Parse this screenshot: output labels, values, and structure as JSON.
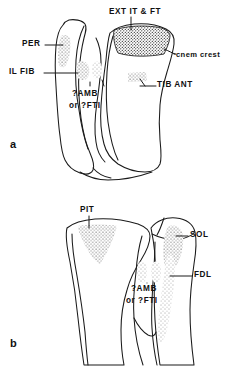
{
  "figure": {
    "type": "anatomical-line-drawing",
    "background_color": "#ffffff",
    "ink_color": "#1a1a1a",
    "width": 234,
    "height": 367
  },
  "panels": [
    {
      "id": "a",
      "letter": "a",
      "view": "anterior",
      "labels": [
        {
          "key": "ext_it_ft",
          "text": "EXT IT & FT",
          "x": 109,
          "y": 8,
          "align": "left"
        },
        {
          "key": "cnem_crest",
          "text": "cnem crest",
          "x": 176,
          "y": 51,
          "align": "left"
        },
        {
          "key": "per",
          "text": "PER",
          "x": 26,
          "y": 41,
          "align": "left"
        },
        {
          "key": "il_fib",
          "text": "IL FIB",
          "x": 12,
          "y": 69,
          "align": "left"
        },
        {
          "key": "tib_ant",
          "text": "TIB ANT",
          "x": 157,
          "y": 82,
          "align": "left"
        },
        {
          "key": "amb_fti_1",
          "text": "?AMB",
          "x": 73,
          "y": 91,
          "align": "left"
        },
        {
          "key": "amb_fti_2",
          "text": "or ?FTI",
          "x": 70,
          "y": 103,
          "align": "left"
        }
      ]
    },
    {
      "id": "b",
      "letter": "b",
      "view": "posterior",
      "labels": [
        {
          "key": "pit",
          "text": "PIT",
          "x": 80,
          "y": 208,
          "align": "left"
        },
        {
          "key": "sol",
          "text": "SOL",
          "x": 190,
          "y": 232,
          "align": "left"
        },
        {
          "key": "fdl",
          "text": "FDL",
          "x": 194,
          "y": 272,
          "align": "left"
        },
        {
          "key": "amb_fti_3",
          "text": "?AMB",
          "x": 131,
          "y": 286,
          "align": "left"
        },
        {
          "key": "amb_fti_4",
          "text": "or ?FTI",
          "x": 126,
          "y": 298,
          "align": "left"
        }
      ]
    }
  ],
  "panel_letters": [
    {
      "key": "letter_a",
      "text": "a",
      "x": 10,
      "y": 139
    },
    {
      "key": "letter_b",
      "text": "b",
      "x": 10,
      "y": 338
    }
  ],
  "muscle_abbreviations": {
    "EXT IT & FT": "extensor iliotibialis and femorotibialis",
    "cnem crest": "cnemial crest",
    "PER": "peroneus",
    "IL FIB": "iliofibularis",
    "TIB ANT": "tibialis anterior",
    "?AMB": "ambiens (uncertain)",
    "?FTI": "femorotibialis internus (uncertain)",
    "PIT": "pubo-ischio-tibialis",
    "SOL": "soleus",
    "FDL": "flexor digitorum longus"
  }
}
